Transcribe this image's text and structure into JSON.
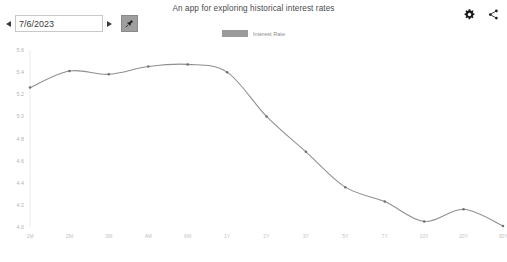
{
  "header": {
    "title": "An app for exploring historical interest rates",
    "date_value": "7/6/2023",
    "prev_label": "◀",
    "next_label": "▶",
    "pin_icon": "pin-icon",
    "settings_icon": "gear-icon",
    "share_icon": "share-icon"
  },
  "legend": {
    "entries": [
      {
        "label": "Interest Rate",
        "color": "#9a9a9a"
      }
    ]
  },
  "chart_data": {
    "type": "line",
    "title": "An app for exploring historical interest rates",
    "xlabel": "",
    "ylabel": "",
    "grid": false,
    "legend_position": "top-center",
    "line_color": "#8f8f8f",
    "categories": [
      "1M",
      "2M",
      "3M",
      "4M",
      "6M",
      "1Y",
      "2Y",
      "3Y",
      "5Y",
      "7Y",
      "10Y",
      "20Y",
      "30Y"
    ],
    "series": [
      {
        "name": "Interest Rate",
        "values": [
          5.26,
          5.41,
          5.38,
          5.45,
          5.47,
          5.4,
          5.0,
          4.68,
          4.36,
          4.23,
          4.05,
          4.16,
          4.01
        ]
      }
    ],
    "ylim": [
      4.0,
      5.6
    ],
    "yticks": [
      4.0,
      4.2,
      4.4,
      4.6,
      4.8,
      5.0,
      5.2,
      5.4,
      5.6
    ],
    "ytick_labels": [
      "4.0",
      "4.2",
      "4.4",
      "4.6",
      "4.8",
      "5.0",
      "5.2",
      "5.4",
      "5.6"
    ]
  }
}
